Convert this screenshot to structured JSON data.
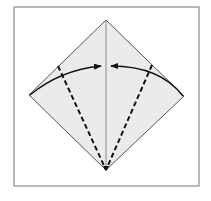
{
  "diagram": {
    "type": "origami-fold-step",
    "frame": {
      "x": 14,
      "y": 7,
      "width": 185,
      "height": 179,
      "stroke": "#8a8a8a"
    },
    "paper": {
      "fill": "#ebebeb",
      "stroke": "#555555",
      "vertices": {
        "top": [
          106,
          20
        ],
        "right": [
          184,
          96
        ],
        "bottom": [
          106,
          170
        ],
        "left": [
          29,
          95
        ]
      }
    },
    "center_crease": {
      "from": [
        106,
        20
      ],
      "to": [
        106,
        170
      ],
      "stroke": "#888888"
    },
    "valley_folds": [
      {
        "name": "left",
        "from": [
          58,
          66
        ],
        "to": [
          106,
          170
        ]
      },
      {
        "name": "right",
        "from": [
          152,
          65
        ],
        "to": [
          106,
          170
        ]
      }
    ],
    "arrows": [
      {
        "name": "left",
        "from": [
          29,
          95
        ],
        "to": [
          101,
          66
        ]
      },
      {
        "name": "right",
        "from": [
          184,
          96
        ],
        "to": [
          111,
          66
        ]
      }
    ],
    "colors": {
      "line": "#111111",
      "dash": "#111111"
    }
  }
}
